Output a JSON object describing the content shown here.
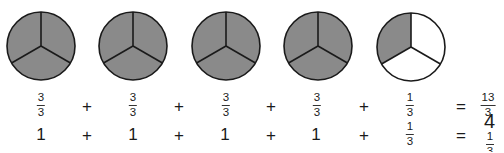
{
  "colors": {
    "shaded": "#8a8a8a",
    "unshaded": "#ffffff",
    "stroke": "#1a1a1a",
    "text": "#1a1a1a"
  },
  "pies": [
    {
      "cx": 41,
      "cy": 46,
      "r": 34,
      "parts": 3,
      "shaded": 3
    },
    {
      "cx": 133,
      "cy": 46,
      "r": 34,
      "parts": 3,
      "shaded": 3
    },
    {
      "cx": 226,
      "cy": 46,
      "r": 34,
      "parts": 3,
      "shaded": 3
    },
    {
      "cx": 318,
      "cy": 46,
      "r": 34,
      "parts": 3,
      "shaded": 3
    },
    {
      "cx": 411,
      "cy": 47,
      "r": 34,
      "parts": 3,
      "shaded": 1
    }
  ],
  "row1": {
    "terms": [
      {
        "num": "3",
        "den": "3"
      },
      {
        "num": "3",
        "den": "3"
      },
      {
        "num": "3",
        "den": "3"
      },
      {
        "num": "3",
        "den": "3"
      },
      {
        "num": "1",
        "den": "3"
      }
    ],
    "operators": [
      "+",
      "+",
      "+",
      "+"
    ],
    "equals": "=",
    "result": {
      "num": "13",
      "den": "3"
    }
  },
  "row2": {
    "terms": [
      "1",
      "1",
      "1",
      "1",
      {
        "num": "1",
        "den": "3"
      }
    ],
    "operators": [
      "+",
      "+",
      "+",
      "+"
    ],
    "equals": "=",
    "result": {
      "whole": "4",
      "num": "1",
      "den": "3"
    }
  }
}
